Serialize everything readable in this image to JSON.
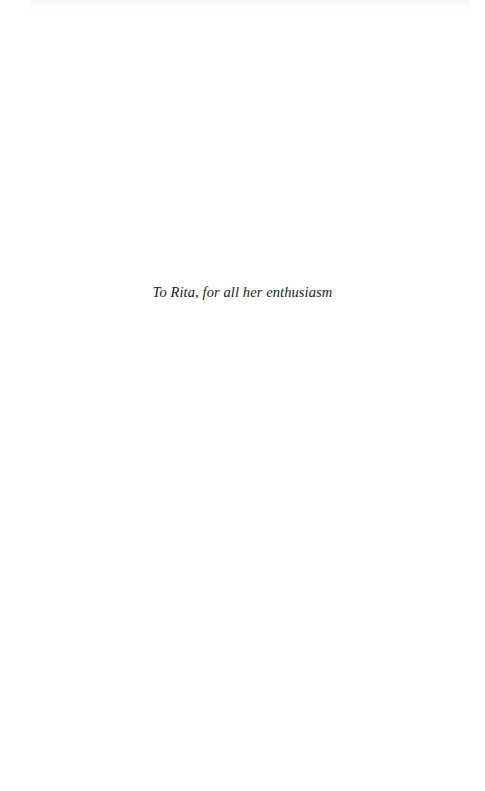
{
  "page": {
    "dedication": "To Rita, for all her enthusiasm"
  },
  "colors": {
    "background": "#ffffff",
    "text": "#1a1a1a"
  }
}
